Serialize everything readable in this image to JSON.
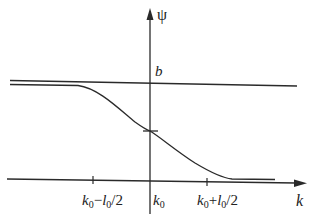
{
  "diagram": {
    "type": "function-plot",
    "axes": {
      "y_label": "ψ",
      "x_label": "k"
    },
    "level_labels": {
      "upper": "b"
    },
    "tick_labels": {
      "left": {
        "base": "k",
        "sub": "0",
        "rest": "−",
        "l": "l",
        "lsub": "0",
        "tail": "/2"
      },
      "center": {
        "base": "k",
        "sub": "0"
      },
      "right": {
        "base": "k",
        "sub": "0",
        "rest": "+",
        "l": "l",
        "lsub": "0",
        "tail": "/2"
      }
    },
    "colors": {
      "line": "#2a2a2a",
      "background": "#ffffff"
    }
  }
}
